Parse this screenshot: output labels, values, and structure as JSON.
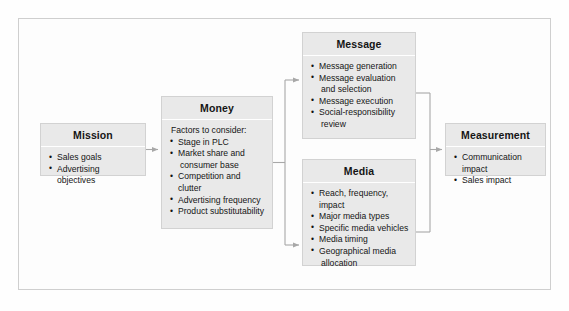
{
  "diagram": {
    "frame_color": "#cfcfcf",
    "node_fill": "#e9e9e9",
    "node_border": "#d2d2d2",
    "connector_color": "#a8a8a8",
    "nodes": [
      {
        "id": "mission",
        "title": "Mission",
        "lead": "",
        "items": [
          {
            "text": "Sales goals",
            "cont": ""
          },
          {
            "text": "Advertising objectives",
            "cont": ""
          }
        ]
      },
      {
        "id": "money",
        "title": "Money",
        "lead": "Factors to consider:",
        "items": [
          {
            "text": "Stage in PLC",
            "cont": ""
          },
          {
            "text": "Market share and",
            "cont": "consumer base"
          },
          {
            "text": "Competition and clutter",
            "cont": ""
          },
          {
            "text": "Advertising frequency",
            "cont": ""
          },
          {
            "text": "Product substitutability",
            "cont": ""
          }
        ]
      },
      {
        "id": "message",
        "title": "Message",
        "lead": "",
        "items": [
          {
            "text": "Message generation",
            "cont": ""
          },
          {
            "text": "Message evaluation",
            "cont": "and selection"
          },
          {
            "text": "Message execution",
            "cont": ""
          },
          {
            "text": "Social-responsibility",
            "cont": "review"
          }
        ]
      },
      {
        "id": "media",
        "title": "Media",
        "lead": "",
        "items": [
          {
            "text": "Reach, frequency, impact",
            "cont": ""
          },
          {
            "text": "Major media types",
            "cont": ""
          },
          {
            "text": "Specific media vehicles",
            "cont": ""
          },
          {
            "text": "Media timing",
            "cont": ""
          },
          {
            "text": "Geographical media",
            "cont": "allocation"
          }
        ]
      },
      {
        "id": "measurement",
        "title": "Measurement",
        "lead": "",
        "items": [
          {
            "text": "Communication impact",
            "cont": ""
          },
          {
            "text": "Sales impact",
            "cont": ""
          }
        ]
      }
    ],
    "edges": [
      {
        "from": "mission",
        "to": "money"
      },
      {
        "from": "money",
        "to": "message"
      },
      {
        "from": "money",
        "to": "media"
      },
      {
        "from": "message",
        "to": "measurement"
      },
      {
        "from": "media",
        "to": "measurement"
      }
    ]
  }
}
